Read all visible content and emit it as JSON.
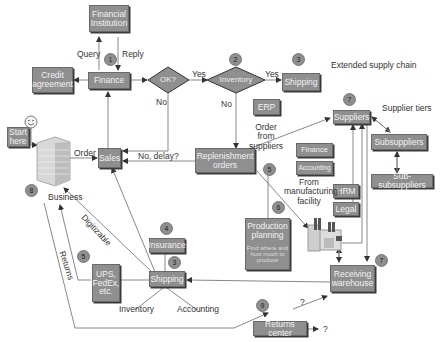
{
  "diagram": {
    "title": "Extended supply chain",
    "nodes": {
      "financial_institution": "Financial Institution",
      "finance": "Finance",
      "credit_agreement": "Credit agreement",
      "ok_decision": "OK?",
      "inventory_decision": "Inventory",
      "shipping_top": "Shipping",
      "erp": "ERP",
      "suppliers": "Suppliers",
      "subsuppliers": "Subsuppliers",
      "sub_subsuppliers": "Sub-subsuppliers",
      "start_here": "Start here",
      "sales": "Sales",
      "replenishment_orders": "Replenishment orders",
      "finance_mfg": "Finance",
      "accounting_mfg": "Accounting",
      "hrm": "HRM",
      "legal": "Legal",
      "production_planning": "Production planning",
      "production_planning_sub": "Find where and how much to produce",
      "insurance": "Insurance",
      "shipping_bottom": "Shipping",
      "ups_fedex": "UPS, FedEx, etc.",
      "receiving_warehouse": "Receiving warehouse",
      "returns_center": "Returns center",
      "business": "Business"
    },
    "labels": {
      "query": "Query",
      "reply": "Reply",
      "yes1": "Yes",
      "yes2": "Yes",
      "no1": "No",
      "no2": "No",
      "order": "Order",
      "no_delay": "No, delay?",
      "order_from_suppliers": "Order from suppliers",
      "supplier_tiers": "Supplier tiers",
      "from_manufacturing": "From manufacturing facility",
      "digitizable": "Digitizable",
      "returns": "Returns",
      "inventory_bottom": "Inventory",
      "accounting_bottom": "Accounting",
      "q1": "?",
      "q2": "?"
    },
    "badges": {
      "b1": "1",
      "b2": "2",
      "b3a": "3",
      "b3b": "3",
      "b4": "4",
      "b5a": "5",
      "b5b": "5",
      "b6": "6",
      "b7a": "7",
      "b7b": "7",
      "b8": "8",
      "b9": "9"
    },
    "colors": {
      "box": "#8f8f8f",
      "line": "#7a7a7a",
      "text": "#333333"
    }
  }
}
